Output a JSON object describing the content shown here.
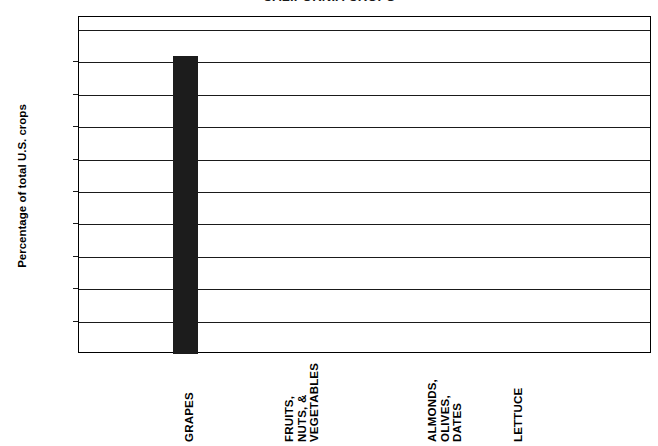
{
  "chart_data": {
    "type": "bar",
    "title": "CALIFORNIA CROPS",
    "subtitle": "",
    "xlabel": "",
    "ylabel": "Percentage of total U.S. crops",
    "categories": [
      "GRAPES",
      "FRUITS, NUTS, & VEGETABLES",
      "ALMONDS, OLIVES, DATES",
      "LETTUCE"
    ],
    "category_lines": [
      [
        "GRAPES"
      ],
      [
        "FRUITS,",
        "NUTS, &",
        "VEGETABLES"
      ],
      [
        "ALMONDS,",
        "OLIVES,",
        "DATES"
      ],
      [
        "LETTUCE"
      ]
    ],
    "values": [
      92,
      0,
      0,
      0
    ],
    "ylim": [
      0,
      100
    ],
    "ytick_values": [
      0,
      10,
      20,
      30,
      40,
      50,
      60,
      70,
      80,
      90,
      100
    ],
    "ytick_labels": [
      "0%",
      "10%",
      "20%",
      "30%",
      "40%",
      "50%",
      "60%",
      "70%",
      "80%",
      "90%",
      "100%"
    ],
    "grid": true,
    "legend": false,
    "legend_position": "none",
    "bar_color": "#1c1c1c",
    "axis_color": "#1a1a1a",
    "background_color": "#ffffff"
  }
}
